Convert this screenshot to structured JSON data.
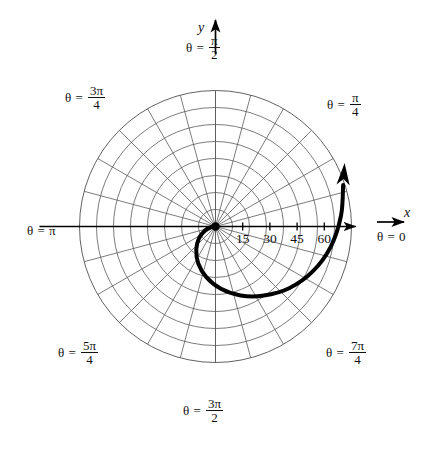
{
  "figure": {
    "type": "polar-graph",
    "background": "#ffffff",
    "grid_color": "#5a5a5a",
    "curve_color": "#000000",
    "axis_color": "#000000"
  },
  "axes": {
    "y_label": "y",
    "x_label": "x"
  },
  "angle_labels": [
    {
      "id": "theta-pi-over-2",
      "theta_deg": 90,
      "eq": "θ =",
      "num": "π",
      "den": "2",
      "whole": null
    },
    {
      "id": "theta-pi-over-4",
      "theta_deg": 45,
      "eq": "θ =",
      "num": "π",
      "den": "4",
      "whole": null
    },
    {
      "id": "theta-3pi-over-4",
      "theta_deg": 135,
      "eq": "θ =",
      "num": "3π",
      "den": "4",
      "whole": null
    },
    {
      "id": "theta-pi",
      "theta_deg": 180,
      "eq": "θ =",
      "num": null,
      "den": null,
      "whole": "π"
    },
    {
      "id": "theta-5pi-over-4",
      "theta_deg": 225,
      "eq": "θ =",
      "num": "5π",
      "den": "4",
      "whole": null
    },
    {
      "id": "theta-3pi-over-2",
      "theta_deg": 270,
      "eq": "θ =",
      "num": "3π",
      "den": "2",
      "whole": null
    },
    {
      "id": "theta-7pi-over-4",
      "theta_deg": 315,
      "eq": "θ =",
      "num": "7π",
      "den": "4",
      "whole": null
    },
    {
      "id": "theta-0",
      "theta_deg": 0,
      "eq": "θ =",
      "num": null,
      "den": null,
      "whole": "0"
    }
  ],
  "radial_ticks": {
    "labels": [
      "15",
      "30",
      "45",
      "60"
    ],
    "values": [
      15,
      30,
      45,
      60
    ]
  },
  "chart_data": {
    "type": "line",
    "plot_kind": "polar-spiral",
    "title": "",
    "xlabel": "x",
    "ylabel": "y",
    "theta_unit": "radians",
    "theta_tick_labels": [
      "θ = 0",
      "θ = π/4",
      "θ = π/2",
      "θ = 3π/4",
      "θ = π",
      "θ = 5π/4",
      "θ = 3π/2",
      "θ = 7π/4"
    ],
    "theta_tick_values_deg": [
      0,
      45,
      90,
      135,
      180,
      225,
      270,
      315
    ],
    "r_tick_labels": [
      "15",
      "30",
      "45",
      "60"
    ],
    "r_tick_values": [
      15,
      30,
      45,
      60
    ],
    "rlim": [
      0,
      75
    ],
    "grid": true,
    "grid_rings": 8,
    "grid_ring_step": 7.5,
    "grid_spokes": 24,
    "grid_spoke_step_deg": 15,
    "legend": null,
    "series": [
      {
        "name": "spiral",
        "description": "Spiral starting at the pole, sweeping clockwise through the fourth and third quadrants and exiting outward in the first quadrant with an arrowhead.",
        "arrow_at_end": true,
        "linewidth": 4,
        "color": "#000000",
        "points_polar_deg": [
          {
            "theta": 170,
            "r": 0.6
          },
          {
            "theta": 186,
            "r": 2.4
          },
          {
            "theta": 200,
            "r": 6.0
          },
          {
            "theta": 215,
            "r": 11.0
          },
          {
            "theta": 230,
            "r": 16.5
          },
          {
            "theta": 245,
            "r": 22.5
          },
          {
            "theta": 260,
            "r": 28.5
          },
          {
            "theta": 275,
            "r": 34.5
          },
          {
            "theta": 290,
            "r": 40.5
          },
          {
            "theta": 305,
            "r": 46.5
          },
          {
            "theta": 320,
            "r": 53.0
          },
          {
            "theta": 335,
            "r": 59.0
          },
          {
            "theta": 350,
            "r": 64.5
          },
          {
            "theta": 365,
            "r": 69.5
          },
          {
            "theta": 378,
            "r": 74.0
          }
        ]
      }
    ]
  }
}
